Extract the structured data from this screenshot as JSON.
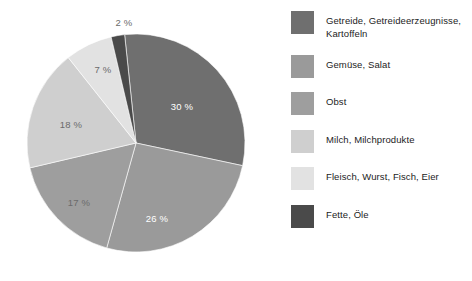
{
  "chart_data": {
    "type": "pie",
    "title": "",
    "subtitle": "",
    "xlabel": "",
    "ylabel": "",
    "grid": false,
    "legend_position": "right",
    "unit": "%",
    "start_angle_deg": -6,
    "categories": [
      "Getreide, Getreideerzeugnisse, Kartoffeln",
      "Gemüse, Salat",
      "Obst",
      "Milch, Milchprodukte",
      "Fleisch, Wurst, Fisch, Eier",
      "Fette, Öle"
    ],
    "values": [
      30,
      26,
      17,
      18,
      7,
      2
    ],
    "colors": [
      "#6f6f6f",
      "#9a9a9a",
      "#9e9e9e",
      "#cfcfcf",
      "#e2e2e2",
      "#4a4a4a"
    ],
    "slices": [
      {
        "label": "Getreide, Getreideerzeugnisse, Kartoffeln",
        "legend_label": "Getreide, Getreideerzeugnisse,\nKartoffeln",
        "value": 30,
        "display": "30 %",
        "color": "#6f6f6f",
        "label_color": "light",
        "label_x": 182,
        "label_y": 106
      },
      {
        "label": "Gemüse, Salat",
        "legend_label": "Gemüse, Salat",
        "value": 26,
        "display": "26 %",
        "color": "#9a9a9a",
        "label_color": "light",
        "label_x": 157,
        "label_y": 218
      },
      {
        "label": "Obst",
        "legend_label": "Obst",
        "value": 17,
        "display": "17 %",
        "color": "#9e9e9e",
        "label_color": "dark",
        "label_x": 79,
        "label_y": 202
      },
      {
        "label": "Milch, Milchprodukte",
        "legend_label": "Milch, Milchprodukte",
        "value": 18,
        "display": "18 %",
        "color": "#cfcfcf",
        "label_color": "dark",
        "label_x": 71,
        "label_y": 124
      },
      {
        "label": "Fleisch, Wurst, Fisch, Eier",
        "legend_label": "Fleisch, Wurst, Fisch, Eier",
        "value": 7,
        "display": "7 %",
        "color": "#e2e2e2",
        "label_color": "dark",
        "label_x": 103,
        "label_y": 69
      },
      {
        "label": "Fette, Öle",
        "legend_label": "Fette, Öle",
        "value": 2,
        "display": "2 %",
        "color": "#4a4a4a",
        "label_color": "dark",
        "label_x": 124,
        "label_y": 22
      }
    ]
  },
  "legend": {
    "items": [
      {
        "label": "Getreide, Getreideerzeugnisse,\nKartoffeln",
        "color": "#6f6f6f"
      },
      {
        "label": "Gemüse, Salat",
        "color": "#9a9a9a"
      },
      {
        "label": "Obst",
        "color": "#9e9e9e"
      },
      {
        "label": "Milch, Milchprodukte",
        "color": "#cfcfcf"
      },
      {
        "label": "Fleisch, Wurst, Fisch, Eier",
        "color": "#e2e2e2"
      },
      {
        "label": "Fette, Öle",
        "color": "#4a4a4a"
      }
    ]
  }
}
